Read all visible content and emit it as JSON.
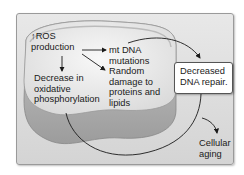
{
  "diagram": {
    "nodes": {
      "ros_arrow": "↑",
      "ros": "ROS",
      "ros_line2": "production",
      "mt_dna": "mt DNA",
      "mt_dna_line2": "mutations",
      "random_damage": [
        "Random",
        "damage to",
        "proteins and",
        "lipids"
      ],
      "decrease_oxphos": [
        "Decrease in",
        "oxidative",
        "phosphorylation"
      ],
      "dna_repair": [
        "Decreased",
        "DNA repair."
      ],
      "aging": [
        "Cellular",
        "aging"
      ]
    },
    "edges": [
      {
        "from": "ROS production",
        "to": "mt DNA mutations"
      },
      {
        "from": "ROS production",
        "to": "Random damage to proteins and lipids"
      },
      {
        "from": "ROS production",
        "to": "Decrease in oxidative phosphorylation"
      },
      {
        "from": "mt DNA mutations",
        "to": "Decreased DNA repair."
      },
      {
        "from": "Decrease in oxidative phosphorylation",
        "to": "Cellular aging"
      },
      {
        "from": "Decreased DNA repair.",
        "to": "Cellular aging"
      }
    ],
    "colors": {
      "panel": "#dcdcdc",
      "mito_top": "#f2f2f2",
      "mito_side": "#b5b5b5",
      "arrow": "#1a1a1a"
    }
  }
}
